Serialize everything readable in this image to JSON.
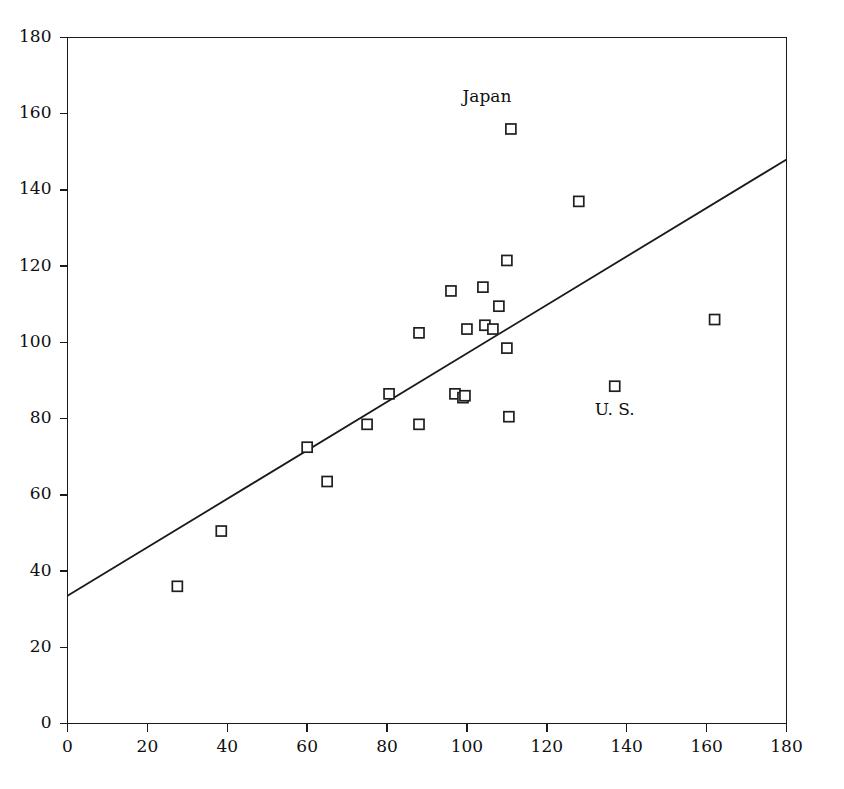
{
  "figure": {
    "background_color": "#ffffff",
    "foreground_color": "#1a1a1a",
    "caption_fragment": ""
  },
  "chart_data": {
    "type": "scatter",
    "title": "",
    "xlabel": "",
    "ylabel": "",
    "xlim": [
      0,
      180
    ],
    "ylim": [
      0,
      180
    ],
    "xticks": [
      0,
      20,
      40,
      60,
      80,
      100,
      120,
      140,
      160,
      180
    ],
    "yticks": [
      0,
      20,
      40,
      60,
      80,
      100,
      120,
      140,
      160,
      180
    ],
    "xtick_labels": [
      "0",
      "20",
      "40",
      "60",
      "80",
      "100",
      "120",
      "140",
      "160",
      "180"
    ],
    "ytick_labels": [
      "0",
      "20",
      "40",
      "60",
      "80",
      "100",
      "120",
      "140",
      "160",
      "180"
    ],
    "grid": false,
    "legend": null,
    "marker_style": "open-square",
    "points": [
      {
        "x": 27.5,
        "y": 36.0
      },
      {
        "x": 38.5,
        "y": 50.5
      },
      {
        "x": 60.0,
        "y": 72.5
      },
      {
        "x": 65.0,
        "y": 63.5
      },
      {
        "x": 75.0,
        "y": 78.5
      },
      {
        "x": 80.5,
        "y": 86.5
      },
      {
        "x": 88.0,
        "y": 78.5
      },
      {
        "x": 88.0,
        "y": 102.5
      },
      {
        "x": 96.0,
        "y": 113.5
      },
      {
        "x": 97.0,
        "y": 86.5
      },
      {
        "x": 99.0,
        "y": 85.5
      },
      {
        "x": 99.5,
        "y": 86.0
      },
      {
        "x": 100.0,
        "y": 103.5
      },
      {
        "x": 104.0,
        "y": 114.5
      },
      {
        "x": 104.5,
        "y": 104.5
      },
      {
        "x": 106.5,
        "y": 103.5
      },
      {
        "x": 108.0,
        "y": 109.5
      },
      {
        "x": 110.0,
        "y": 121.5
      },
      {
        "x": 110.0,
        "y": 98.5
      },
      {
        "x": 110.5,
        "y": 80.5
      },
      {
        "x": 111.0,
        "y": 156.0
      },
      {
        "x": 128.0,
        "y": 137.0
      },
      {
        "x": 137.0,
        "y": 88.5
      },
      {
        "x": 162.0,
        "y": 106.0
      }
    ],
    "fit_line": {
      "x_start": 0,
      "y_start": 33.5,
      "x_end": 180,
      "y_end": 148.0,
      "slope": 0.636,
      "intercept": 33.5
    },
    "annotations": [
      {
        "label": "Japan",
        "x": 105.0,
        "y": 163.0,
        "point_x": 111.0,
        "point_y": 156.0
      },
      {
        "label": "U. S.",
        "x": 137.0,
        "y": 81.0,
        "point_x": 137.0,
        "point_y": 88.5
      }
    ]
  }
}
